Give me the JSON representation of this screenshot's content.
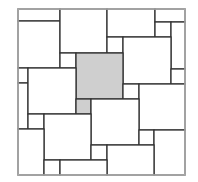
{
  "diagram": {
    "outer_border_color": "#b0b0b0",
    "line_color": "#333333",
    "fill_white": "#ffffff",
    "fill_highlight": "#cfcfcf",
    "outer": {
      "x": 18,
      "y": 9,
      "w": 167,
      "h": 166
    },
    "tiles": [
      {
        "id": "t1",
        "x": 18,
        "y": 9,
        "w": 42,
        "h": 12,
        "highlight": false
      },
      {
        "id": "t2",
        "x": 18,
        "y": 21,
        "w": 42,
        "h": 47,
        "highlight": false
      },
      {
        "id": "t3",
        "x": 60,
        "y": 9,
        "w": 47,
        "h": 44,
        "highlight": false
      },
      {
        "id": "t4",
        "x": 107,
        "y": 9,
        "w": 48,
        "h": 28,
        "highlight": false
      },
      {
        "id": "t5",
        "x": 155,
        "y": 9,
        "w": 30,
        "h": 13,
        "highlight": false
      },
      {
        "id": "t6",
        "x": 155,
        "y": 22,
        "w": 16,
        "h": 15,
        "highlight": false
      },
      {
        "id": "t7",
        "x": 171,
        "y": 22,
        "w": 14,
        "h": 47,
        "highlight": false
      },
      {
        "id": "t8",
        "x": 107,
        "y": 37,
        "w": 16,
        "h": 16,
        "highlight": false
      },
      {
        "id": "t9",
        "x": 123,
        "y": 37,
        "w": 48,
        "h": 47,
        "highlight": false
      },
      {
        "id": "t10",
        "x": 171,
        "y": 69,
        "w": 14,
        "h": 15,
        "highlight": false
      },
      {
        "id": "t11",
        "x": 60,
        "y": 53,
        "w": 16,
        "h": 15,
        "highlight": false
      },
      {
        "id": "t12",
        "x": 76,
        "y": 53,
        "w": 47,
        "h": 46,
        "highlight": true
      },
      {
        "id": "t13",
        "x": 18,
        "y": 68,
        "w": 10,
        "h": 15,
        "highlight": false
      },
      {
        "id": "t14",
        "x": 18,
        "y": 83,
        "w": 10,
        "h": 46,
        "highlight": false
      },
      {
        "id": "t15",
        "x": 28,
        "y": 68,
        "w": 48,
        "h": 46,
        "highlight": false
      },
      {
        "id": "t16",
        "x": 123,
        "y": 84,
        "w": 16,
        "h": 15,
        "highlight": false
      },
      {
        "id": "t17",
        "x": 139,
        "y": 84,
        "w": 46,
        "h": 46,
        "highlight": false
      },
      {
        "id": "t18",
        "x": 76,
        "y": 99,
        "w": 15,
        "h": 15,
        "highlight": true
      },
      {
        "id": "t19",
        "x": 91,
        "y": 99,
        "w": 48,
        "h": 46,
        "highlight": false
      },
      {
        "id": "t20",
        "x": 28,
        "y": 114,
        "w": 16,
        "h": 15,
        "highlight": false
      },
      {
        "id": "t21",
        "x": 44,
        "y": 114,
        "w": 47,
        "h": 46,
        "highlight": false
      },
      {
        "id": "t22",
        "x": 18,
        "y": 129,
        "w": 26,
        "h": 46,
        "highlight": false
      },
      {
        "id": "t23",
        "x": 139,
        "y": 130,
        "w": 15,
        "h": 15,
        "highlight": false
      },
      {
        "id": "t24",
        "x": 154,
        "y": 130,
        "w": 31,
        "h": 45,
        "highlight": false
      },
      {
        "id": "t25",
        "x": 91,
        "y": 145,
        "w": 16,
        "h": 15,
        "highlight": false
      },
      {
        "id": "t26",
        "x": 107,
        "y": 145,
        "w": 47,
        "h": 30,
        "highlight": false
      },
      {
        "id": "t27",
        "x": 44,
        "y": 160,
        "w": 16,
        "h": 15,
        "highlight": false
      },
      {
        "id": "t28",
        "x": 60,
        "y": 160,
        "w": 47,
        "h": 15,
        "highlight": false
      }
    ]
  }
}
